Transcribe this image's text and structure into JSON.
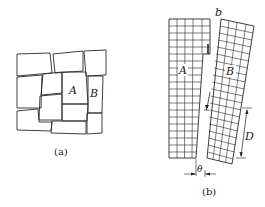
{
  "figure_a": {
    "caption": "(a)",
    "labels": {
      "block_a": "A",
      "block_b": "B"
    }
  },
  "figure_b": {
    "caption": "(b)",
    "labels": {
      "column_a": "A",
      "column_b": "B",
      "top_mark": "b",
      "spacing": "D",
      "angle": "θ"
    }
  }
}
